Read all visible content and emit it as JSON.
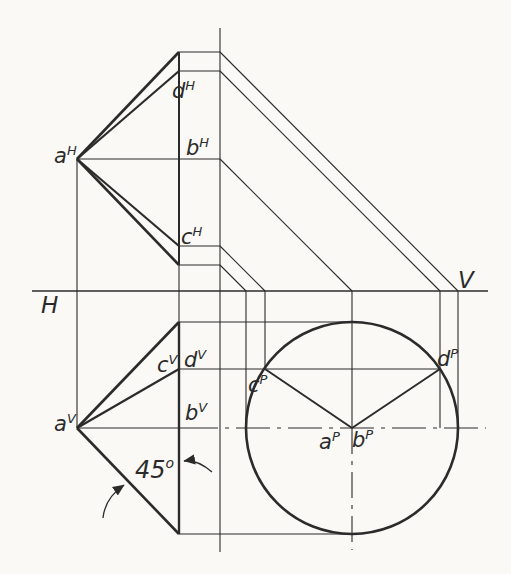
{
  "figure": {
    "paper_color": "#faf9f6",
    "ink_color": "#2b2b2b",
    "width": 511,
    "height": 574,
    "plane_labels": [
      {
        "name": "label-H-plane",
        "text": "H",
        "x": 41,
        "y": 313,
        "size": 23
      },
      {
        "name": "label-V-plane",
        "text": "V",
        "x": 458,
        "y": 288,
        "size": 23
      }
    ],
    "angle_label": {
      "name": "label-45-degrees",
      "text": "45",
      "sup": "o",
      "x": 135,
      "y": 478,
      "size": 24,
      "sup_size": 14,
      "sup_rise": -10
    },
    "point_labels": [
      {
        "name": "label-a-H",
        "main": "a",
        "sup": "H",
        "x": 54,
        "y": 163
      },
      {
        "name": "label-d-H",
        "main": "d",
        "sup": "H",
        "x": 172,
        "y": 98
      },
      {
        "name": "label-b-H",
        "main": "b",
        "sup": "H",
        "x": 186,
        "y": 155
      },
      {
        "name": "label-c-H",
        "main": "c",
        "sup": "H",
        "x": 181,
        "y": 244
      },
      {
        "name": "label-a-V",
        "main": "a",
        "sup": "V",
        "x": 54,
        "y": 431
      },
      {
        "name": "label-c-V",
        "main": "c",
        "sup": "V",
        "x": 157,
        "y": 372
      },
      {
        "name": "label-d-V",
        "main": "d",
        "sup": "V",
        "x": 184,
        "y": 367
      },
      {
        "name": "label-b-V",
        "main": "b",
        "sup": "V",
        "x": 185,
        "y": 420
      },
      {
        "name": "label-c-P",
        "main": "c",
        "sup": "P",
        "x": 248,
        "y": 392
      },
      {
        "name": "label-d-P",
        "main": "d",
        "sup": "P",
        "x": 437,
        "y": 366
      },
      {
        "name": "label-a-P",
        "main": "a",
        "sup": "P",
        "x": 319,
        "y": 449
      },
      {
        "name": "label-b-P",
        "main": "b",
        "sup": "P",
        "x": 352,
        "y": 447
      }
    ],
    "circle": {
      "name": "profile-circle",
      "cx": 352,
      "cy": 428,
      "r": 106,
      "w": 2.6
    },
    "lines": [
      {
        "name": "fold-line-HV",
        "x1": 32,
        "y1": 291,
        "x2": 488,
        "y2": 291,
        "w": 1.4
      },
      {
        "name": "projector-a",
        "x1": 77,
        "y1": 159,
        "x2": 77,
        "y2": 428,
        "w": 1.1
      },
      {
        "name": "base-edge-H",
        "x1": 179,
        "y1": 52,
        "x2": 179,
        "y2": 265,
        "w": 2.0
      },
      {
        "name": "base-transfer-vertical",
        "x1": 179,
        "y1": 265,
        "x2": 179,
        "y2": 322,
        "w": 1.1
      },
      {
        "name": "base-edge-V",
        "x1": 179,
        "y1": 322,
        "x2": 179,
        "y2": 534,
        "w": 2.4
      },
      {
        "name": "miter-vertical",
        "x1": 220,
        "y1": 28,
        "x2": 220,
        "y2": 552,
        "w": 1.1
      },
      {
        "name": "H-fan-top-extreme",
        "x1": 77,
        "y1": 159,
        "x2": 179,
        "y2": 52,
        "w": 2.6
      },
      {
        "name": "H-fan-edge-d",
        "x1": 77,
        "y1": 159,
        "x2": 179,
        "y2": 71,
        "w": 2.2
      },
      {
        "name": "H-axis-ab",
        "x1": 77,
        "y1": 159,
        "x2": 220,
        "y2": 159,
        "w": 1.1
      },
      {
        "name": "H-fan-edge-c",
        "x1": 77,
        "y1": 159,
        "x2": 179,
        "y2": 246,
        "w": 2.2
      },
      {
        "name": "H-fan-bottom-extreme",
        "x1": 77,
        "y1": 159,
        "x2": 179,
        "y2": 265,
        "w": 2.6
      },
      {
        "name": "H-step-top",
        "x1": 179,
        "y1": 52,
        "x2": 220,
        "y2": 52,
        "w": 1.1
      },
      {
        "name": "H-step-d",
        "x1": 179,
        "y1": 71,
        "x2": 220,
        "y2": 71,
        "w": 1.1
      },
      {
        "name": "H-step-c",
        "x1": 179,
        "y1": 246,
        "x2": 220,
        "y2": 246,
        "w": 1.1
      },
      {
        "name": "H-step-bottom",
        "x1": 179,
        "y1": 265,
        "x2": 220,
        "y2": 265,
        "w": 1.1
      },
      {
        "name": "miter-diagonal-top",
        "x1": 220,
        "y1": 52,
        "x2": 458,
        "y2": 291,
        "w": 1.1
      },
      {
        "name": "miter-diagonal-d",
        "x1": 220,
        "y1": 71,
        "x2": 440,
        "y2": 291,
        "w": 1.1
      },
      {
        "name": "miter-diagonal-b",
        "x1": 220,
        "y1": 159,
        "x2": 352,
        "y2": 291,
        "w": 1.1
      },
      {
        "name": "miter-diagonal-c",
        "x1": 220,
        "y1": 246,
        "x2": 265,
        "y2": 291,
        "w": 1.1
      },
      {
        "name": "miter-diagonal-bottom",
        "x1": 220,
        "y1": 265,
        "x2": 246,
        "y2": 291,
        "w": 1.1
      },
      {
        "name": "V-fan-top-extreme",
        "x1": 77,
        "y1": 428,
        "x2": 179,
        "y2": 322,
        "w": 2.6
      },
      {
        "name": "V-fan-edge-cd",
        "x1": 77,
        "y1": 428,
        "x2": 179,
        "y2": 369,
        "w": 2.2
      },
      {
        "name": "V-axis-solid",
        "x1": 77,
        "y1": 428,
        "x2": 184,
        "y2": 428,
        "w": 1.1
      },
      {
        "name": "V-fan-bottom-extreme",
        "x1": 77,
        "y1": 428,
        "x2": 179,
        "y2": 534,
        "w": 2.6
      },
      {
        "name": "transfer-top-tangent",
        "x1": 179,
        "y1": 322,
        "x2": 352,
        "y2": 322,
        "w": 1.1
      },
      {
        "name": "transfer-cd-level",
        "x1": 179,
        "y1": 369,
        "x2": 440,
        "y2": 369,
        "w": 1.1
      },
      {
        "name": "transfer-bottom-tangent",
        "x1": 179,
        "y1": 534,
        "x2": 352,
        "y2": 534,
        "w": 1.1
      },
      {
        "name": "center-line-horizontal",
        "x1": 184,
        "y1": 428,
        "x2": 486,
        "y2": 428,
        "w": 1.1,
        "dash": "34 7 4 7"
      },
      {
        "name": "P-vertical-left-tangent",
        "x1": 246,
        "y1": 291,
        "x2": 246,
        "y2": 428,
        "w": 1.1
      },
      {
        "name": "P-vertical-c",
        "x1": 265,
        "y1": 291,
        "x2": 265,
        "y2": 369,
        "w": 1.1
      },
      {
        "name": "P-vertical-center",
        "x1": 352,
        "y1": 291,
        "x2": 352,
        "y2": 428,
        "w": 1.1
      },
      {
        "name": "center-line-vertical",
        "x1": 352,
        "y1": 428,
        "x2": 352,
        "y2": 550,
        "w": 1.1,
        "dash": "26 7 4 7"
      },
      {
        "name": "P-vertical-d",
        "x1": 440,
        "y1": 291,
        "x2": 440,
        "y2": 428,
        "w": 1.1
      },
      {
        "name": "P-vertical-right-tangent",
        "x1": 458,
        "y1": 291,
        "x2": 458,
        "y2": 428,
        "w": 1.1
      },
      {
        "name": "P-radius-c",
        "x1": 352,
        "y1": 428,
        "x2": 265,
        "y2": 369,
        "w": 2.0
      },
      {
        "name": "P-radius-d",
        "x1": 352,
        "y1": 428,
        "x2": 440,
        "y2": 369,
        "w": 2.0
      }
    ],
    "arrows": [
      {
        "name": "angle-arrow-lower",
        "path": "M 103 518 Q 105 498 124 485"
      },
      {
        "name": "angle-arrow-right",
        "path": "M 212 472 Q 197 459 184 461"
      }
    ],
    "label_font": {
      "main_size": 21,
      "sup_size": 13,
      "sup_rise": -8
    }
  }
}
